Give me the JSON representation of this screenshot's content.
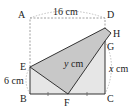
{
  "diagram": {
    "points": {
      "A": {
        "label": "A",
        "x": 30,
        "y": 18
      },
      "D": {
        "label": "D",
        "x": 105,
        "y": 18
      },
      "H": {
        "label": "H",
        "x": 111,
        "y": 33
      },
      "G": {
        "label": "G",
        "x": 105,
        "y": 41
      },
      "E": {
        "label": "E",
        "x": 30,
        "y": 67
      },
      "B": {
        "label": "B",
        "x": 30,
        "y": 94
      },
      "F": {
        "label": "F",
        "x": 68,
        "y": 94
      },
      "C": {
        "label": "C",
        "x": 105,
        "y": 94
      }
    },
    "measurements": {
      "top": "16 cm",
      "left": "6 cm",
      "diagonal_var": "y",
      "diagonal_unit": " cm",
      "right_var": "x",
      "right_unit": " cm"
    },
    "colors": {
      "folded_flap": "#c8c8c8",
      "rectangle_fill": "#e6e6e6",
      "stroke": "#333333",
      "dashed": "#888888"
    }
  }
}
